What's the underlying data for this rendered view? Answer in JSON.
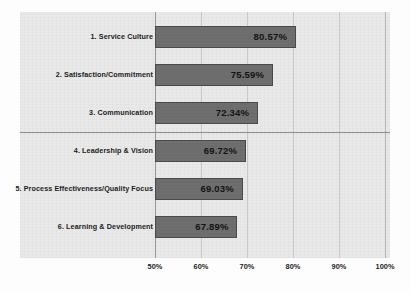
{
  "chart_data": {
    "type": "bar",
    "orientation": "horizontal",
    "title": "",
    "xlabel": "",
    "ylabel": "",
    "categories": [
      "1. Service Culture",
      "2. Satisfaction/Commitment",
      "3. Communication",
      "4. Leadership & Vision",
      "5. Process Effectiveness/Quality Focus",
      "6. Learning & Development"
    ],
    "values": [
      80.57,
      69.72,
      72.34,
      69.72,
      69.03,
      67.89
    ],
    "value_labels": [
      "80.57%",
      "75.59%",
      "72.34%",
      "69.72%",
      "69.03%",
      "67.89%"
    ],
    "bar_values": [
      80.57,
      75.59,
      72.34,
      69.72,
      69.03,
      67.89
    ],
    "xlim": [
      50,
      100
    ],
    "xticks": [
      50,
      60,
      70,
      80,
      90,
      100
    ],
    "xtick_labels": [
      "50%",
      "60%",
      "70%",
      "80%",
      "90%",
      "100%"
    ],
    "grid": true,
    "legend": false,
    "bar_color": "#6e6e6e",
    "bar_border_color": "#4a4a4a",
    "plot_background": "#e9e9e9",
    "gridline_color": "#c9c9c9",
    "divider_after_category_index": 2,
    "annotations": []
  }
}
